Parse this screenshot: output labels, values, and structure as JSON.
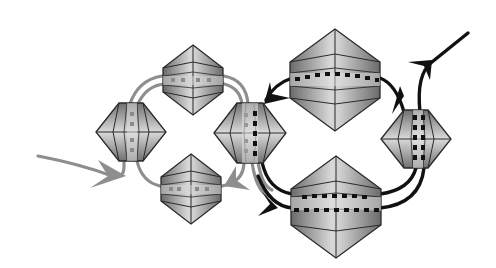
{
  "diagram": {
    "title": "Two coupled loops of octahedral crystals",
    "colors": {
      "background": "#ffffff",
      "crystal_edge": "#2a2a2a",
      "crystal_dark": "#6e6e6e",
      "crystal_light": "#e4e4e4",
      "left_loop_path": "#8c8c8c",
      "right_loop_path": "#111111",
      "slot_left": "#8a8a8a",
      "slot_right": "#111111"
    },
    "left_loop": {
      "label": "grey loop",
      "crystals": [
        {
          "id": "left-top",
          "cx": 193,
          "cy": 80,
          "w": 62,
          "h": 70,
          "orientation": "horizontal-band"
        },
        {
          "id": "left-left",
          "cx": 131,
          "cy": 132,
          "w": 70,
          "h": 58,
          "orientation": "vertical-band"
        },
        {
          "id": "left-bottom",
          "cx": 191,
          "cy": 189,
          "w": 62,
          "h": 70,
          "orientation": "horizontal-band"
        }
      ],
      "input_arrow": {
        "from": [
          38,
          156
        ],
        "to": [
          125,
          178
        ]
      }
    },
    "shared_crystal": {
      "id": "center",
      "cx": 250,
      "cy": 133,
      "w": 72,
      "h": 60,
      "orientation": "vertical-band"
    },
    "right_loop": {
      "label": "black loop",
      "crystals": [
        {
          "id": "right-top",
          "cx": 335,
          "cy": 80,
          "w": 90,
          "h": 102,
          "orientation": "horizontal-band"
        },
        {
          "id": "right-right",
          "cx": 416,
          "cy": 139,
          "w": 70,
          "h": 58,
          "orientation": "vertical-band"
        },
        {
          "id": "right-bottom",
          "cx": 336,
          "cy": 207,
          "w": 90,
          "h": 102,
          "orientation": "horizontal-band"
        }
      ],
      "output_arrow": {
        "to": [
          468,
          33
        ]
      }
    }
  }
}
